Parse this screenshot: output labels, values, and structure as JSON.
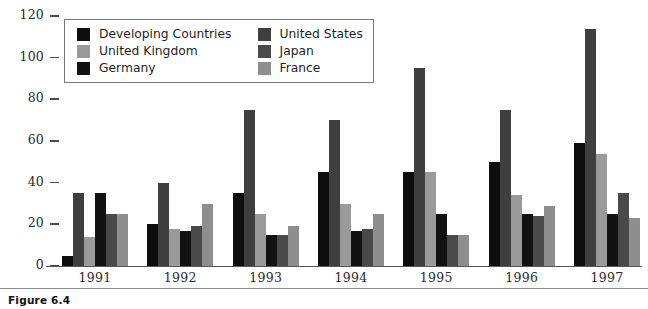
{
  "caption": "Figure 6.4",
  "chart_data": {
    "type": "bar",
    "title": "",
    "xlabel": "",
    "ylabel": "",
    "ylim": [
      0,
      120
    ],
    "yticks": [
      0,
      20,
      40,
      60,
      80,
      100,
      120
    ],
    "grid": false,
    "legend_position": "top-left-inside",
    "categories": [
      "1991",
      "1992",
      "1993",
      "1994",
      "1995",
      "1996",
      "1997"
    ],
    "series": [
      {
        "name": "Developing Countries",
        "color": "#0d0d0d",
        "values": [
          5,
          20,
          35,
          45,
          45,
          50,
          59
        ]
      },
      {
        "name": "United States",
        "color": "#3f3f3f",
        "values": [
          35,
          40,
          75,
          70,
          95,
          75,
          114
        ]
      },
      {
        "name": "United Kingdom",
        "color": "#9a9a9a",
        "values": [
          14,
          18,
          25,
          30,
          45,
          34,
          54
        ]
      },
      {
        "name": "Germany",
        "color": "#121212",
        "values": [
          35,
          17,
          15,
          17,
          25,
          25,
          25
        ]
      },
      {
        "name": "Japan",
        "color": "#4a4a4a",
        "values": [
          25,
          19,
          15,
          18,
          15,
          24,
          35
        ]
      },
      {
        "name": "France",
        "color": "#8e8e8e",
        "values": [
          25,
          30,
          19,
          25,
          15,
          29,
          23
        ]
      }
    ]
  }
}
